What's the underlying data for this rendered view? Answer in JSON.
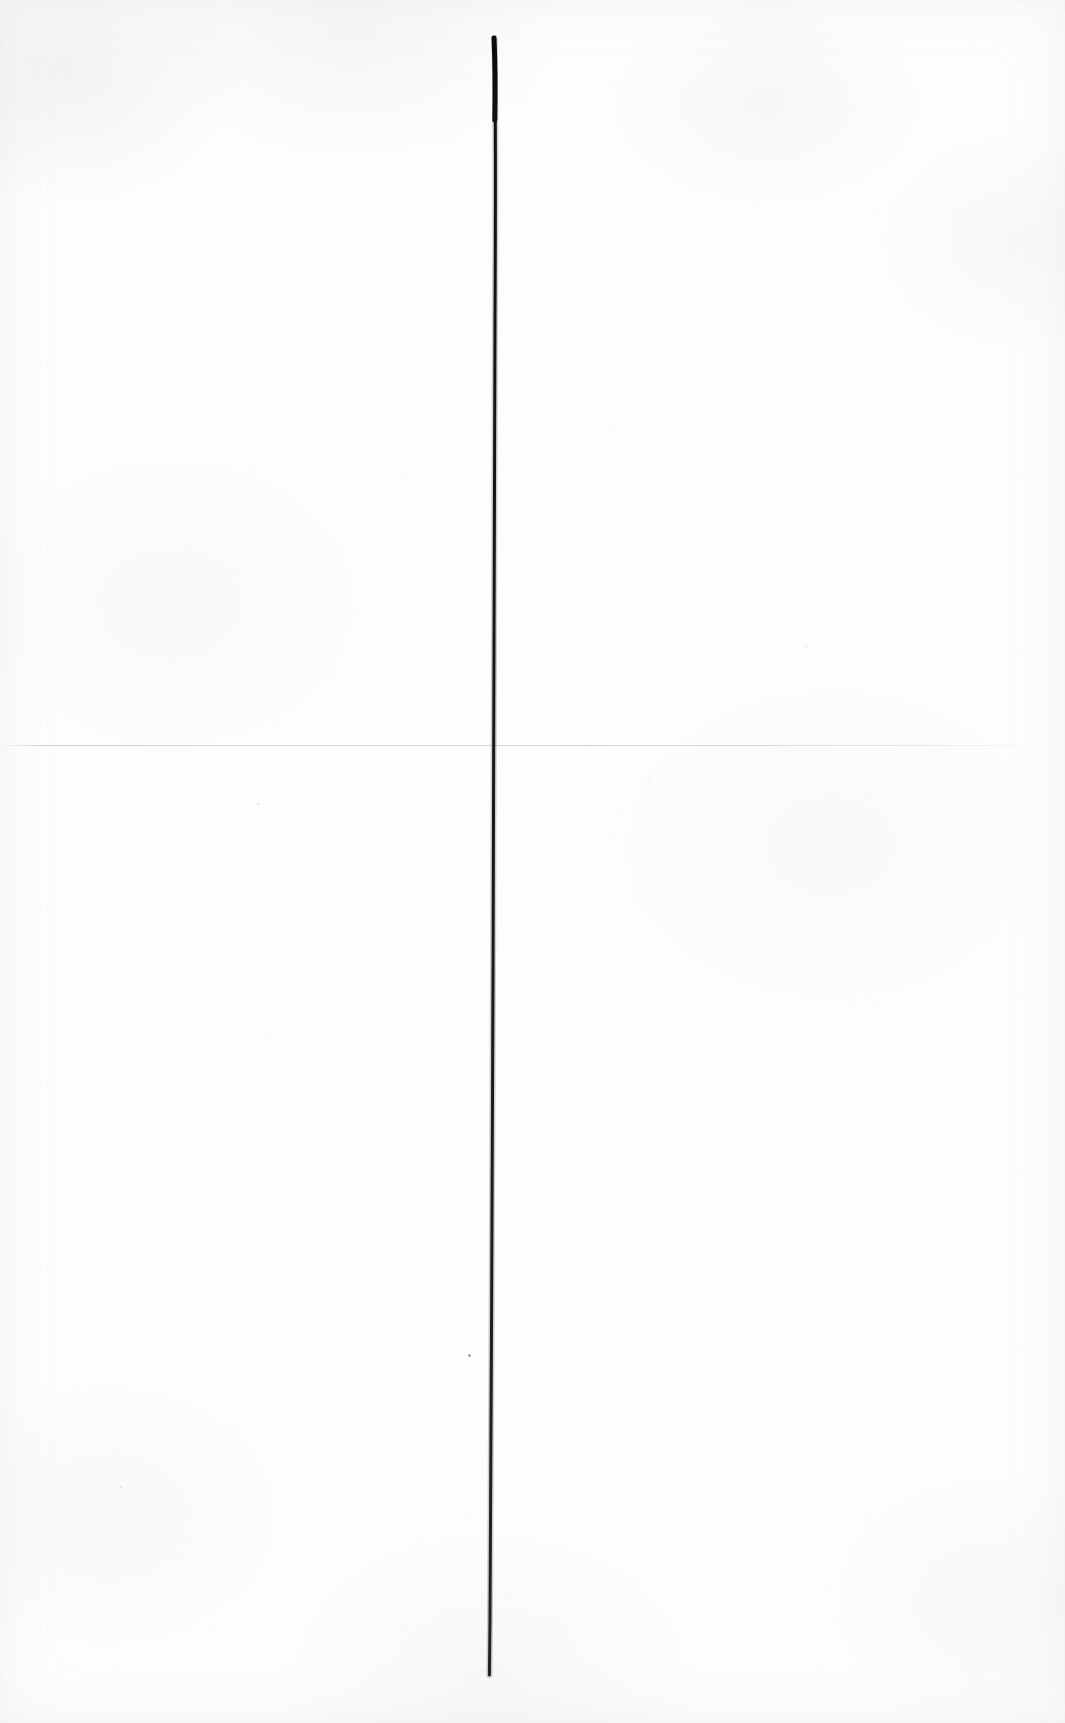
{
  "document": {
    "kind": "scanned-paper-sheet",
    "orientation": "portrait",
    "visible_text": "",
    "caption": ""
  },
  "colors": {
    "paper": "#fdfdfd",
    "paper_shade": "#f4f4f5",
    "ink": "#111111",
    "ink_soft": "#2a2a2c",
    "crease": "#a8a8ad"
  },
  "marks": {
    "ink_line": {
      "label": "vertical-ink-line",
      "description": "single hand-drawn vertical black ink stroke",
      "top_x": 494,
      "top_y": 38,
      "bottom_x": 489,
      "bottom_y": 1675,
      "max_width_px": 5,
      "min_width_px": 2,
      "path": "M 494.5 38 C 496 120, 495.5 220, 495 320 C 494.6 430, 494.2 540, 494 650 C 493.7 760, 493.3 870, 493 980 C 492.6 1090, 492.1 1200, 491.6 1310 C 491.2 1420, 490.6 1530, 490.0 1620 L 489.4 1675",
      "widths": [
        5.2,
        4.2,
        3.6,
        3.3,
        3.2,
        3.1,
        3.0,
        2.9,
        2.8,
        2.7,
        2.6,
        2.5,
        2.3,
        2.2
      ]
    },
    "crease_line": {
      "label": "horizontal-paper-crease",
      "y": 745,
      "x_start": 0,
      "x_end": 1065
    },
    "specks": [
      {
        "x": 470,
        "y": 1356,
        "r": 1.6
      },
      {
        "x": 258,
        "y": 804,
        "r": 1.2
      },
      {
        "x": 121,
        "y": 1487,
        "r": 1.1
      },
      {
        "x": 806,
        "y": 646,
        "r": 1.0
      }
    ]
  },
  "canvas": {
    "width": 1065,
    "height": 1723
  }
}
